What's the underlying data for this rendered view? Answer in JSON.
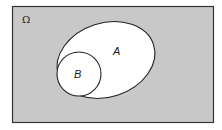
{
  "diagram": {
    "type": "venn",
    "universe": {
      "label": "Ω",
      "fill": "#c8c8c8",
      "stroke": "#333333"
    },
    "sets": [
      {
        "label": "A",
        "fill": "#ffffff",
        "stroke": "#222222"
      },
      {
        "label": "B",
        "fill": "#ffffff",
        "stroke": "#222222"
      }
    ],
    "relationship": "B is a subset of A"
  }
}
